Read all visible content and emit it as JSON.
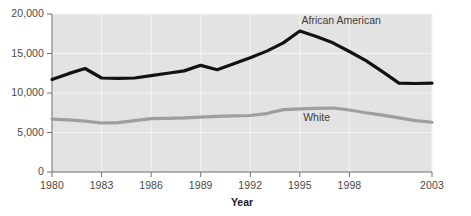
{
  "chart_data": {
    "type": "line",
    "title": "",
    "xlabel": "Year",
    "ylabel": "",
    "xlim": [
      1980,
      2003
    ],
    "ylim": [
      0,
      20000
    ],
    "grid": true,
    "legend_position": "inline-annotation",
    "plot_background": "#e3e3e3",
    "x_ticks": [
      "1980",
      "1983",
      "1986",
      "1989",
      "1992",
      "1995",
      "1998",
      "2003"
    ],
    "x_tick_values": [
      1980,
      1983,
      1986,
      1989,
      1992,
      1995,
      1998,
      2003
    ],
    "y_ticks": [
      "0",
      "5,000",
      "10,000",
      "15,000",
      "20,000"
    ],
    "y_tick_values": [
      0,
      5000,
      10000,
      15000,
      20000
    ],
    "x": [
      1980,
      1981,
      1982,
      1983,
      1984,
      1985,
      1986,
      1987,
      1988,
      1989,
      1990,
      1991,
      1992,
      1993,
      1994,
      1995,
      1996,
      1997,
      1998,
      1999,
      2000,
      2001,
      2002,
      2003
    ],
    "series": [
      {
        "name": "African American",
        "color": "#121212",
        "width": 3.2,
        "label_x": 1995.1,
        "label_y": 19100,
        "values": [
          11700,
          12450,
          13100,
          11900,
          11850,
          11900,
          12200,
          12500,
          12800,
          13500,
          12950,
          13700,
          14450,
          15300,
          16350,
          17850,
          17150,
          16350,
          15250,
          14100,
          12700,
          11250,
          11200,
          11250
        ]
      },
      {
        "name": "White",
        "color": "#9e9e9e",
        "width": 3.2,
        "label_x": 1995.2,
        "label_y": 6850,
        "values": [
          6700,
          6600,
          6450,
          6200,
          6250,
          6500,
          6750,
          6800,
          6850,
          6950,
          7050,
          7100,
          7150,
          7400,
          7900,
          8000,
          8050,
          8100,
          7850,
          7500,
          7200,
          6850,
          6500,
          6300
        ]
      }
    ]
  }
}
